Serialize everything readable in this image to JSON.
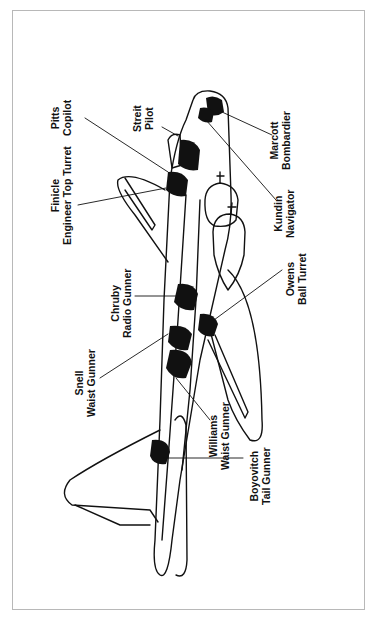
{
  "figure": {
    "orientation": "rotated 90 degrees (nose at top, tail at bottom)",
    "border_color": "#b8b8b8",
    "ink_color": "#111111"
  },
  "crew": [
    {
      "id": "marcott",
      "name": "Marcott",
      "role": "Bombardier"
    },
    {
      "id": "kundin",
      "name": "Kundin",
      "role": "Navigator"
    },
    {
      "id": "streit",
      "name": "Streit",
      "role": "Pilot"
    },
    {
      "id": "pitts",
      "name": "Pitts",
      "role": "Copilot"
    },
    {
      "id": "finicle",
      "name": "Finicle",
      "role": "Engineer Top Turret"
    },
    {
      "id": "chruby",
      "name": "Chruby",
      "role": "Radio Gunner"
    },
    {
      "id": "owens",
      "name": "Owens",
      "role": "Ball Turret"
    },
    {
      "id": "snell",
      "name": "Snell",
      "role": "Waist Gunner"
    },
    {
      "id": "williams",
      "name": "Williams",
      "role": "Waist Gunner"
    },
    {
      "id": "boyovitch",
      "name": "Boyovitch",
      "role": "Tail Gunner"
    }
  ]
}
